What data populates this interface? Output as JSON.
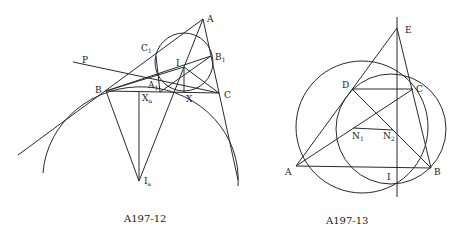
{
  "figures": [
    {
      "caption": "A197-12",
      "labels": {
        "A": "A",
        "B": "B",
        "C": "C",
        "I": "I",
        "P": "P",
        "C1": "C",
        "C1_sub": "1",
        "B1": "B",
        "B1_sub": "1",
        "A1": "A",
        "A1_sub": "1",
        "X": "X",
        "Xa": "X",
        "Xa_sub": "a",
        "Ia": "I",
        "Ia_sub": "a"
      }
    },
    {
      "caption": "A197-13",
      "labels": {
        "A": "A",
        "B": "B",
        "C": "C",
        "D": "D",
        "E": "E",
        "I": "I",
        "N1": "N",
        "N1_sub": "1",
        "N2": "N",
        "N2_sub": "2"
      }
    }
  ],
  "colors": {
    "line": "#2a2a2a",
    "text": "#1a1a1a",
    "background": "#ffffff"
  }
}
